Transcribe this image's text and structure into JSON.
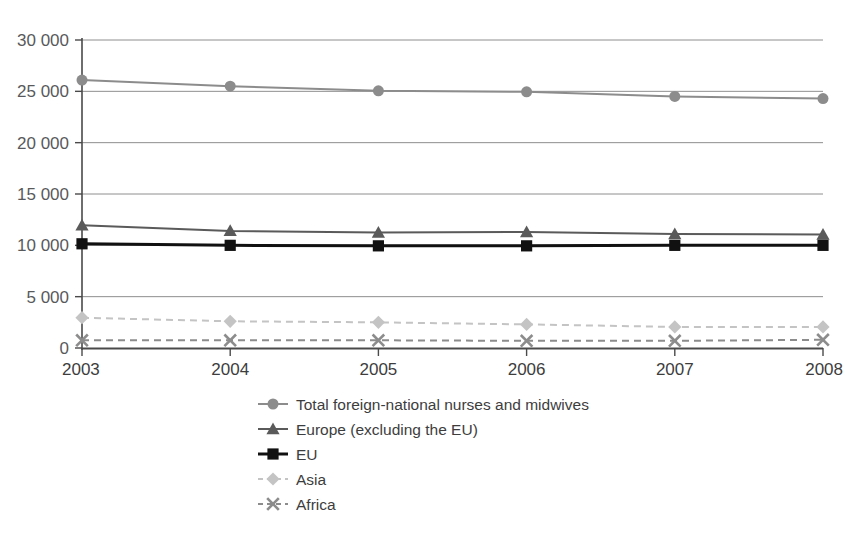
{
  "chart_data": {
    "type": "line",
    "title": "",
    "subtitle": "",
    "xlabel": "",
    "ylabel": "",
    "categories": [
      "2003",
      "2004",
      "2005",
      "2006",
      "2007",
      "2008"
    ],
    "x": [
      2003,
      2004,
      2005,
      2006,
      2007,
      2008
    ],
    "ylim": [
      0,
      30000
    ],
    "yticks": [
      0,
      5000,
      10000,
      15000,
      20000,
      25000,
      30000
    ],
    "ytick_labels": [
      "0",
      "5 000",
      "10 000",
      "15 000",
      "20 000",
      "25 000",
      "30 000"
    ],
    "grid": "horizontal",
    "legend_position": "bottom-center",
    "series": [
      {
        "name": "Total foreign-national nurses and midwives",
        "marker": "circle",
        "line_style": "solid",
        "color": "#8c8c8c",
        "values": [
          26100,
          25500,
          25050,
          24950,
          24500,
          24300
        ]
      },
      {
        "name": "Europe (excluding the EU)",
        "marker": "triangle",
        "line_style": "solid",
        "color": "#5a5a5a",
        "values": [
          11950,
          11400,
          11250,
          11300,
          11100,
          11050
        ]
      },
      {
        "name": "EU",
        "marker": "square",
        "line_style": "solid",
        "color": "#111111",
        "values": [
          10150,
          10000,
          9950,
          9950,
          10000,
          10000
        ]
      },
      {
        "name": "Asia",
        "marker": "diamond",
        "line_style": "dashed",
        "color": "#c4c4c4",
        "values": [
          2950,
          2600,
          2500,
          2300,
          2050,
          2050
        ]
      },
      {
        "name": "Africa",
        "marker": "x",
        "line_style": "dashed",
        "color": "#8c8c8c",
        "values": [
          750,
          750,
          750,
          700,
          700,
          800
        ]
      }
    ]
  },
  "axis": {
    "y_tick_labels": [
      "30 000",
      "25 000",
      "20 000",
      "15 000",
      "10 000",
      "5 000",
      "0"
    ],
    "x_tick_labels": [
      "2003",
      "2004",
      "2005",
      "2006",
      "2007",
      "2008"
    ]
  },
  "legend": {
    "items": [
      {
        "label": "Total foreign-national nurses and midwives",
        "marker": "circle-marker-icon"
      },
      {
        "label": "Europe (excluding the EU)",
        "marker": "triangle-marker-icon"
      },
      {
        "label": "EU",
        "marker": "square-marker-icon"
      },
      {
        "label": "Asia",
        "marker": "diamond-marker-icon"
      },
      {
        "label": "Africa",
        "marker": "x-marker-icon"
      }
    ]
  },
  "colors": {
    "total": "#8c8c8c",
    "europe": "#5a5a5a",
    "eu": "#111111",
    "asia": "#c4c4c4",
    "africa": "#8c8c8c",
    "grid": "#8e8e8e",
    "axis": "#4a4a4a",
    "text": "#3d3d3d"
  }
}
